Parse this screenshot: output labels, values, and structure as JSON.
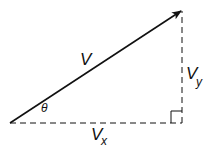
{
  "diagram": {
    "type": "vector-components",
    "labels": {
      "vector": "V",
      "y_component": "V",
      "y_subscript": "y",
      "x_component": "V",
      "x_subscript": "x",
      "angle": "θ"
    },
    "colors": {
      "stroke": "#111111",
      "background": "#ffffff"
    }
  }
}
